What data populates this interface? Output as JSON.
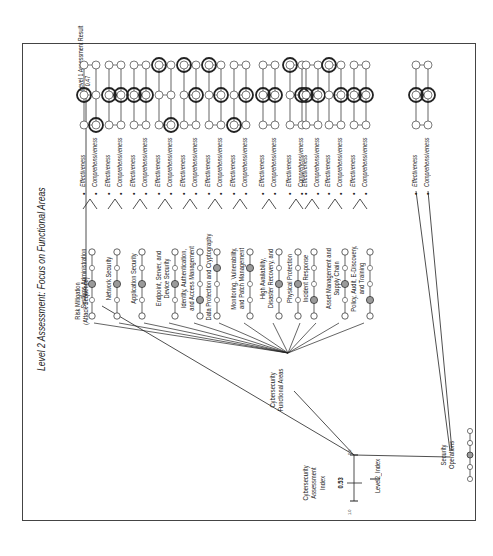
{
  "title": "Level 2 Assessment: Focus on Functional Areas",
  "index": {
    "label_lines": [
      "Cybersecurity",
      "Assessment",
      "Index"
    ],
    "value": "0.53",
    "scale_max": "1.0",
    "scale_min": "0.0",
    "arrow_label": "Level2_Index"
  },
  "branches": {
    "risk_mitigation": [
      "Risk Mitigation",
      "(Attack Sequence)"
    ],
    "functional_areas": [
      "Cybersecurity",
      "Functional Areas"
    ],
    "security_operations": [
      "Security",
      "Operations"
    ]
  },
  "level1_result": {
    "line1": "Level 1 Assessment Result",
    "line2": "= 0.47"
  },
  "scale_ticks": [
    "1.0",
    ".75",
    ".50",
    ".25",
    "0.0"
  ],
  "circle_values": [
    "1.0",
    "0.5",
    "0.0"
  ],
  "criteria": {
    "effectiveness": "Effectiveness",
    "comprehensiveness": "Comprehensiveness"
  },
  "functional_areas": [
    {
      "name": [
        "Systems Administration"
      ],
      "marker": 2,
      "eff": 1,
      "comp": 0
    },
    {
      "name": [
        "Network Security"
      ],
      "marker": 2,
      "eff": 1,
      "comp": 1
    },
    {
      "name": [
        "Application Security"
      ],
      "marker": 2,
      "eff": 1,
      "comp": 1
    },
    {
      "name": [
        "Endpoint, Server, and",
        "Device Security"
      ],
      "marker": 2,
      "eff": 2,
      "comp": 0
    },
    {
      "name": [
        "Identity, Authentication,",
        "and Access Management"
      ],
      "marker": 1,
      "eff": 2,
      "comp": 1
    },
    {
      "name": [
        "Data Protection and Cryptography"
      ],
      "marker": 3,
      "eff": 2,
      "comp": 1
    },
    {
      "name": [
        "Monitoring, Vulnerability,",
        "and Patch Management"
      ],
      "marker": 3,
      "eff": 0,
      "comp": 1
    },
    {
      "name": [
        "High Availability,",
        "Disaster Recovery, and"
      ],
      "marker": 2,
      "eff": 1,
      "comp": 1
    },
    {
      "name": [
        "Physical Protection"
      ],
      "marker": 2,
      "eff": 2,
      "comp": 1
    },
    {
      "name": [
        "Incident Response"
      ],
      "marker": 1,
      "eff": 1,
      "comp": 1
    },
    {
      "name": [
        "Asset Management and",
        "Supply Chain"
      ],
      "marker": 2,
      "eff": 2,
      "comp": 1
    },
    {
      "name": [
        "Policy, Audit, E-Discovery,",
        "and Training"
      ],
      "marker": 1,
      "eff": 1,
      "comp": 1
    },
    {
      "name": [
        "Security Operations"
      ],
      "marker": 2,
      "eff": 1,
      "comp": 1
    }
  ],
  "colors": {
    "line": "#222222",
    "marker_fill": "#9a9a9a",
    "frame": "#444444"
  }
}
